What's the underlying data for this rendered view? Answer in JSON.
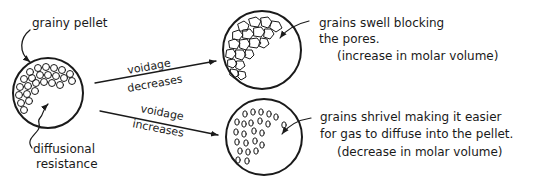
{
  "diagram": {
    "type": "hand-drawn schematic",
    "colors": {
      "ink": "#1a1a1a",
      "background": "#ffffff"
    },
    "pellet": {
      "label": "grainy pellet",
      "resistance_label_line1": "diffusional",
      "resistance_label_line2": "resistance"
    },
    "top_path": {
      "arrow_label_top": "voidage",
      "arrow_label_bottom": "decreases",
      "note_line1": "grains swell blocking",
      "note_line2": "the pores.",
      "note_line3": "(increase in molar volume)"
    },
    "bottom_path": {
      "arrow_label_top": "voidage",
      "arrow_label_bottom": "increases",
      "note_line1": "grains shrivel making it easier",
      "note_line2": "for gas to diffuse into the pellet.",
      "note_line3": "(decrease in molar volume)"
    }
  }
}
